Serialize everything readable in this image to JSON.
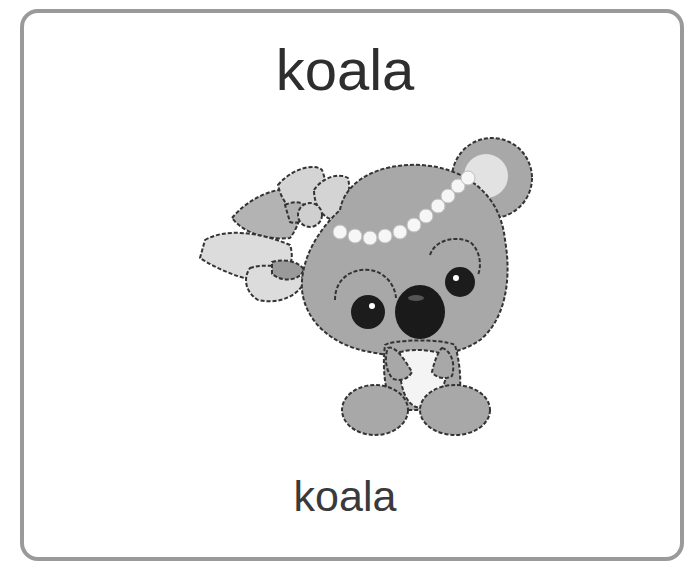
{
  "card": {
    "title": "koala",
    "label": "koala",
    "border_color": "#9a9a9a",
    "text_color": "#2e2e2e"
  },
  "illustration": {
    "subject": "koala-cartoon",
    "description": "Cartoon koala with bow and pearl necklace on head",
    "fur_color": "#a8a8a8",
    "bow_color": "#d6d6d6",
    "nose_color": "#1a1a1a"
  }
}
